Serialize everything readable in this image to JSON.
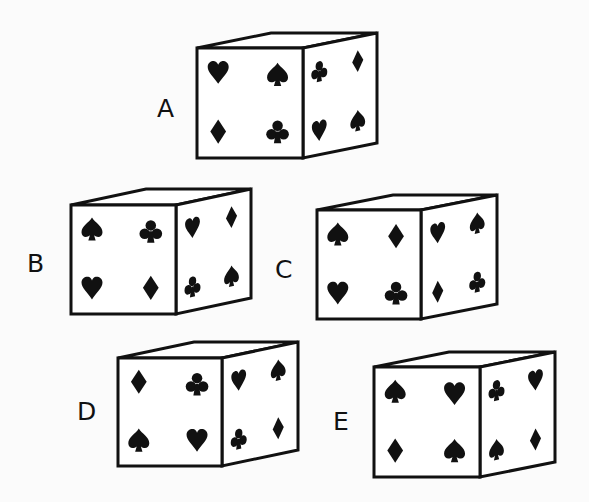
{
  "puzzle": {
    "type": "cube-folding-comparison",
    "suits": [
      "spade",
      "heart",
      "diamond",
      "club"
    ],
    "colors": {
      "ink": "#111111",
      "face": "#ffffff",
      "background": "#fbfbfb"
    }
  },
  "cubes": [
    {
      "id": "A",
      "label": "A",
      "label_pos": [
        157,
        96
      ],
      "front": {
        "x": 197,
        "y": 48,
        "w": 106,
        "h": 110
      },
      "depth": {
        "dx": 74,
        "dy": -15
      },
      "front_symbols": [
        "heart",
        "spade",
        "diamond",
        "club"
      ],
      "side_symbols": [
        "club",
        "diamond",
        "heart",
        "spade"
      ]
    },
    {
      "id": "B",
      "label": "B",
      "label_pos": [
        27,
        251
      ],
      "front": {
        "x": 71,
        "y": 205,
        "w": 105,
        "h": 109
      },
      "depth": {
        "dx": 75,
        "dy": -16
      },
      "front_symbols": [
        "spade",
        "club",
        "heart",
        "diamond"
      ],
      "side_symbols": [
        "heart",
        "diamond",
        "club",
        "spade"
      ]
    },
    {
      "id": "C",
      "label": "C",
      "label_pos": [
        275,
        257
      ],
      "front": {
        "x": 317,
        "y": 210,
        "w": 104,
        "h": 109
      },
      "depth": {
        "dx": 76,
        "dy": -15
      },
      "front_symbols": [
        "spade",
        "diamond",
        "heart",
        "club"
      ],
      "side_symbols": [
        "heart",
        "spade",
        "diamond",
        "club"
      ]
    },
    {
      "id": "D",
      "label": "D",
      "label_pos": [
        77,
        399
      ],
      "front": {
        "x": 118,
        "y": 358,
        "w": 104,
        "h": 108
      },
      "depth": {
        "dx": 76,
        "dy": -16
      },
      "front_symbols": [
        "diamond",
        "club",
        "spade",
        "heart"
      ],
      "side_symbols": [
        "heart",
        "spade",
        "club",
        "diamond"
      ]
    },
    {
      "id": "E",
      "label": "E",
      "label_pos": [
        333,
        409
      ],
      "front": {
        "x": 374,
        "y": 367,
        "w": 106,
        "h": 110
      },
      "depth": {
        "dx": 75,
        "dy": -15
      },
      "front_symbols": [
        "spade",
        "heart",
        "diamond",
        "spade"
      ],
      "side_symbols": [
        "club",
        "heart",
        "spade",
        "diamond"
      ]
    }
  ]
}
